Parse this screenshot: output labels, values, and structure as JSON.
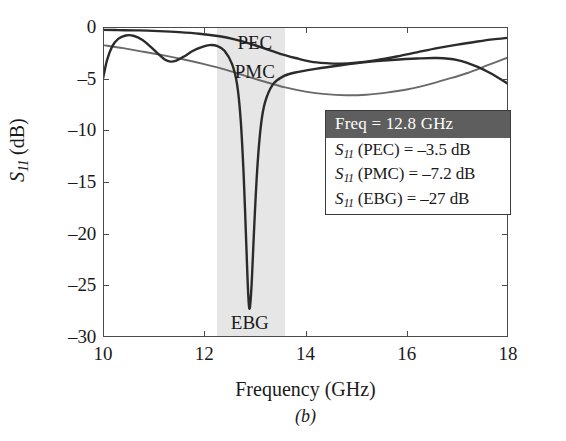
{
  "figure": {
    "caption": "(b)"
  },
  "chart_data": {
    "type": "line",
    "title": "",
    "xlabel": "Frequency (GHz)",
    "ylabel": "S11 (dB)",
    "ylabel_symbol": "S",
    "ylabel_sub": "11",
    "ylabel_unit": " (dB)",
    "xlim": [
      10,
      18
    ],
    "ylim": [
      -30,
      0
    ],
    "xticks": [
      10,
      12,
      14,
      16,
      18
    ],
    "yticks": [
      0,
      -5,
      -10,
      -15,
      -20,
      -25,
      -30
    ],
    "xtick_labels": [
      "10",
      "12",
      "14",
      "16",
      "18"
    ],
    "ytick_labels": [
      "0",
      "–5",
      "–10",
      "–15",
      "–20",
      "–25",
      "–30"
    ],
    "grid": false,
    "legend_position": "inline-labels",
    "shaded_band": {
      "label": "operating band",
      "x_start": 12.25,
      "x_end": 13.6,
      "color": "#e6e6e6"
    },
    "series": [
      {
        "name": "PEC",
        "color": "#2b2b2b",
        "label_x": 13.0,
        "label_y": -1.55,
        "points": [
          [
            10.0,
            -0.28
          ],
          [
            10.3,
            -0.3
          ],
          [
            10.7,
            -0.33
          ],
          [
            11.1,
            -0.4
          ],
          [
            11.5,
            -0.5
          ],
          [
            11.9,
            -0.65
          ],
          [
            12.3,
            -0.9
          ],
          [
            12.6,
            -1.2
          ],
          [
            12.9,
            -1.6
          ],
          [
            13.2,
            -2.1
          ],
          [
            13.5,
            -2.6
          ],
          [
            13.8,
            -3.0
          ],
          [
            14.1,
            -3.35
          ],
          [
            14.4,
            -3.5
          ],
          [
            14.7,
            -3.55
          ],
          [
            15.0,
            -3.45
          ],
          [
            15.4,
            -3.2
          ],
          [
            15.8,
            -2.85
          ],
          [
            16.2,
            -2.45
          ],
          [
            16.6,
            -2.05
          ],
          [
            17.0,
            -1.7
          ],
          [
            17.4,
            -1.4
          ],
          [
            17.7,
            -1.2
          ],
          [
            18.0,
            -1.05
          ]
        ]
      },
      {
        "name": "PMC",
        "color": "#6a6a6a",
        "label_x": 13.0,
        "label_y": -4.35,
        "points": [
          [
            10.0,
            -1.75
          ],
          [
            10.4,
            -2.05
          ],
          [
            10.8,
            -2.4
          ],
          [
            11.2,
            -2.75
          ],
          [
            11.6,
            -3.15
          ],
          [
            12.0,
            -3.6
          ],
          [
            12.4,
            -4.1
          ],
          [
            12.8,
            -4.7
          ],
          [
            13.2,
            -5.3
          ],
          [
            13.6,
            -5.85
          ],
          [
            14.0,
            -6.25
          ],
          [
            14.4,
            -6.5
          ],
          [
            14.8,
            -6.6
          ],
          [
            15.2,
            -6.55
          ],
          [
            15.6,
            -6.35
          ],
          [
            16.0,
            -6.05
          ],
          [
            16.4,
            -5.6
          ],
          [
            16.8,
            -5.05
          ],
          [
            17.2,
            -4.45
          ],
          [
            17.6,
            -3.7
          ],
          [
            18.0,
            -2.95
          ]
        ]
      },
      {
        "name": "EBG",
        "color": "#2b2b2b",
        "label_x": 12.9,
        "label_y": -28.6,
        "points": [
          [
            10.0,
            -5.0
          ],
          [
            10.08,
            -3.2
          ],
          [
            10.18,
            -1.9
          ],
          [
            10.3,
            -1.15
          ],
          [
            10.45,
            -0.82
          ],
          [
            10.6,
            -0.85
          ],
          [
            10.78,
            -1.25
          ],
          [
            10.95,
            -1.95
          ],
          [
            11.1,
            -2.65
          ],
          [
            11.22,
            -3.15
          ],
          [
            11.33,
            -3.35
          ],
          [
            11.45,
            -3.25
          ],
          [
            11.6,
            -2.85
          ],
          [
            11.78,
            -2.3
          ],
          [
            11.95,
            -1.95
          ],
          [
            12.1,
            -1.75
          ],
          [
            12.25,
            -1.82
          ],
          [
            12.4,
            -2.3
          ],
          [
            12.55,
            -3.6
          ],
          [
            12.65,
            -5.6
          ],
          [
            12.72,
            -9.0
          ],
          [
            12.78,
            -14.5
          ],
          [
            12.83,
            -21.0
          ],
          [
            12.87,
            -26.0
          ],
          [
            12.9,
            -27.2
          ],
          [
            12.94,
            -24.5
          ],
          [
            12.99,
            -19.0
          ],
          [
            13.05,
            -13.5
          ],
          [
            13.12,
            -9.5
          ],
          [
            13.2,
            -7.3
          ],
          [
            13.35,
            -5.6
          ],
          [
            13.55,
            -4.8
          ],
          [
            13.8,
            -4.4
          ],
          [
            14.2,
            -4.05
          ],
          [
            14.7,
            -3.7
          ],
          [
            15.2,
            -3.4
          ],
          [
            15.7,
            -3.2
          ],
          [
            16.2,
            -3.05
          ],
          [
            16.6,
            -3.0
          ],
          [
            17.0,
            -3.2
          ],
          [
            17.4,
            -3.85
          ],
          [
            17.7,
            -4.6
          ],
          [
            18.0,
            -5.5
          ]
        ]
      }
    ],
    "annotation": {
      "header": "Freq = 12.8 GHz",
      "header_bg": "#5e5e5e",
      "rows": [
        {
          "symbol": "S",
          "sub": "11",
          "text": " (PEC) = –3.5 dB"
        },
        {
          "symbol": "S",
          "sub": "11",
          "text": " (PMC) = –7.2 dB"
        },
        {
          "symbol": "S",
          "sub": "11",
          "text": " (EBG) = –27 dB"
        }
      ]
    }
  }
}
